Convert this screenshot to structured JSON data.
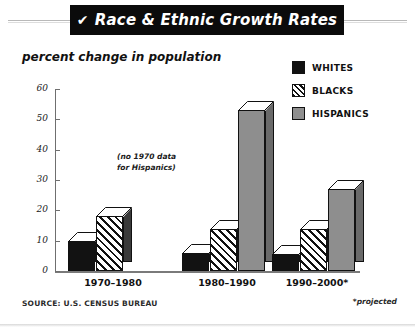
{
  "header": {
    "check_icon": "check-mark",
    "title": "Race & Ethnic Growth Rates"
  },
  "subtitle": "percent change in population",
  "legend": {
    "position": "top-right",
    "items": [
      {
        "label": "WHITES",
        "swatch": "solid-black",
        "color": "#121212"
      },
      {
        "label": "BLACKS",
        "swatch": "diagonal-hatch",
        "color": "#111111"
      },
      {
        "label": "HISPANICS",
        "swatch": "solid-gray",
        "color": "#8e8e8e"
      }
    ]
  },
  "annotation": {
    "line1": "(no 1970 data",
    "line2": "for Hispanics)"
  },
  "footer": {
    "source": "SOURCE: U.S. CENSUS BUREAU",
    "projected_note": "*projected"
  },
  "axis": {
    "y_ticks": [
      "0",
      "10",
      "20",
      "30",
      "40",
      "50",
      "60"
    ]
  },
  "chart_data": {
    "type": "bar",
    "title": "Race & Ethnic Growth Rates",
    "subtitle": "percent change in population",
    "xlabel": "",
    "ylabel": "percent change in population",
    "ylim": [
      0,
      60
    ],
    "ytick_step": 10,
    "grid": false,
    "legend_position": "top-right",
    "style": "3d-bars",
    "categories": [
      "1970–1980",
      "1980–1990",
      "1990–2000*"
    ],
    "series": [
      {
        "name": "WHITES",
        "values": [
          10,
          6,
          5.5
        ]
      },
      {
        "name": "BLACKS",
        "values": [
          18,
          14,
          14
        ]
      },
      {
        "name": "HISPANICS",
        "values": [
          null,
          53,
          27
        ]
      }
    ],
    "annotations": [
      "(no 1970 data for Hispanics)"
    ],
    "notes": [
      "*projected"
    ],
    "source": "SOURCE: U.S. CENSUS BUREAU"
  }
}
